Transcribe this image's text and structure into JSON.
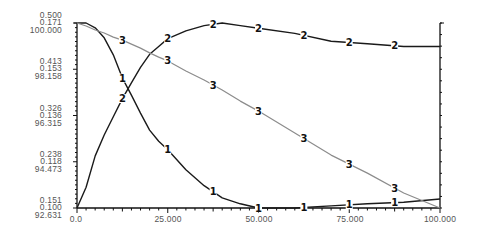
{
  "chart_data": {
    "type": "line",
    "title": "",
    "xlabel": "",
    "ylabel": "",
    "grid": false,
    "legend": "inline numeric markers on each curve (1, 2, 3)",
    "xlim": [
      0,
      100
    ],
    "x_tick_values": [
      0,
      25,
      50,
      75,
      100
    ],
    "x_tick_labels": [
      "0.0",
      "25.000",
      "50.000",
      "75.000",
      "100.000"
    ],
    "y_axes": [
      {
        "name": "axis-1",
        "ylim": [
          0.151,
          0.5
        ],
        "tick_labels": [
          "0.500",
          "0.413",
          "0.326",
          "0.238",
          "0.151"
        ]
      },
      {
        "name": "axis-2",
        "ylim": [
          0.1,
          0.171
        ],
        "tick_labels": [
          "0.171",
          "0.153",
          "0.136",
          "0.118",
          "0.100"
        ]
      },
      {
        "name": "axis-3",
        "ylim": [
          92.631,
          100.0
        ],
        "tick_labels": [
          "100.000",
          "98.158",
          "96.315",
          "94.473",
          "92.631"
        ]
      }
    ],
    "x": [
      0,
      2.5,
      5,
      7.5,
      10,
      12.5,
      15,
      17.5,
      20,
      22.5,
      25,
      30,
      35,
      40,
      45,
      50,
      60,
      70,
      80,
      90,
      100
    ],
    "series": [
      {
        "name": "1",
        "axis": 0,
        "color": "#1a1a1a",
        "values": [
          0.5,
          0.5,
          0.491,
          0.472,
          0.44,
          0.396,
          0.364,
          0.33,
          0.298,
          0.277,
          0.261,
          0.223,
          0.193,
          0.17,
          0.159,
          0.151,
          0.151,
          0.155,
          0.159,
          0.162,
          0.168
        ]
      },
      {
        "name": "2",
        "axis": 1,
        "color": "#1a1a1a",
        "values": [
          0.1,
          0.108,
          0.12,
          0.128,
          0.135,
          0.142,
          0.148,
          0.154,
          0.159,
          0.162,
          0.165,
          0.168,
          0.17,
          0.171,
          0.17,
          0.169,
          0.167,
          0.164,
          0.163,
          0.162,
          0.162
        ]
      },
      {
        "name": "3",
        "axis": 2,
        "color": "#8c8c8c",
        "values": [
          100.0,
          99.88,
          99.72,
          99.6,
          99.44,
          99.32,
          99.16,
          99.0,
          98.81,
          98.64,
          98.49,
          98.09,
          97.73,
          97.33,
          96.89,
          96.49,
          95.62,
          94.74,
          94.02,
          93.23,
          92.63
        ]
      }
    ],
    "marker_x": [
      12.5,
      25,
      37.5,
      50,
      62.5,
      75,
      87.5
    ]
  }
}
